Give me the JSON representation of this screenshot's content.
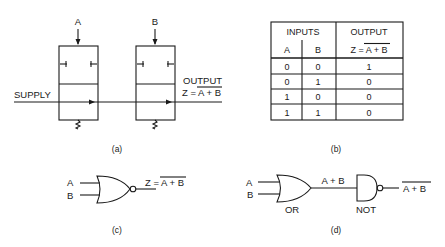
{
  "figure": {
    "panel_a": {
      "caption": "(a)",
      "valve_a_label": "A",
      "valve_b_label": "B",
      "supply_label": "SUPPLY",
      "output_label": "OUTPUT",
      "output_expr_prefix": "Z = ",
      "output_expr_overlined": "A + B"
    },
    "panel_b": {
      "caption": "(b)",
      "header_inputs": "INPUTS",
      "header_output": "OUTPUT",
      "col_a": "A",
      "col_b": "B",
      "col_out_prefix": "Z = ",
      "col_out_overlined": "A + B",
      "rows": [
        {
          "a": "0",
          "b": "0",
          "z": "1"
        },
        {
          "a": "0",
          "b": "1",
          "z": "0"
        },
        {
          "a": "1",
          "b": "0",
          "z": "0"
        },
        {
          "a": "1",
          "b": "1",
          "z": "0"
        }
      ]
    },
    "panel_c": {
      "caption": "(c)",
      "input_a": "A",
      "input_b": "B",
      "output_prefix": "Z = ",
      "output_overlined": "A + B"
    },
    "panel_d": {
      "caption": "(d)",
      "input_a": "A",
      "input_b": "B",
      "or_label": "OR",
      "not_label": "NOT",
      "intermediate_label": "A + B",
      "output_overlined": "A + B"
    }
  }
}
